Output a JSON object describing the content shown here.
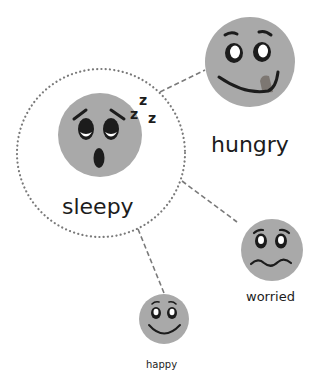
{
  "diagram": {
    "type": "emotion-relationship-map",
    "center_node": {
      "id": "sleepy",
      "label": "sleepy",
      "face": "sleepy-face",
      "sound_effect": [
        "z",
        "z",
        "z"
      ],
      "enclosure": "dotted-circle"
    },
    "nodes": [
      {
        "id": "hungry",
        "label": "hungry",
        "face": "hungry-face"
      },
      {
        "id": "worried",
        "label": "worried",
        "face": "worried-face"
      },
      {
        "id": "happy",
        "label": "happy",
        "face": "happy-face"
      }
    ],
    "edges": [
      {
        "from": "sleepy",
        "to": "hungry",
        "style": "dashed"
      },
      {
        "from": "sleepy",
        "to": "worried",
        "style": "dashed"
      },
      {
        "from": "sleepy",
        "to": "happy",
        "style": "dashed"
      }
    ],
    "colors": {
      "face_fill": "#a9a9a9",
      "feature_stroke": "#1c1c1c",
      "tongue": "#7d7772",
      "connector": "#7a7a7a",
      "dotted_circle": "#7a7a7a",
      "background": "#ffffff"
    }
  }
}
